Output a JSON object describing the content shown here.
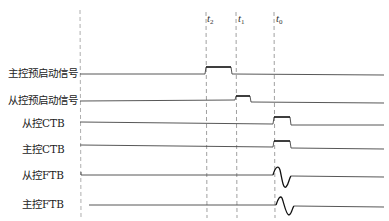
{
  "diagram": {
    "type": "timing-diagram",
    "colors": {
      "signal": "#444444",
      "pulse": "#222222",
      "dashed": "#888888",
      "background": "#ffffff"
    },
    "time_markers": [
      {
        "id": "t2",
        "base": "t",
        "sub": "2",
        "x": 206
      },
      {
        "id": "t1",
        "base": "t",
        "sub": "1",
        "x": 236
      },
      {
        "id": "t0",
        "base": "t",
        "sub": "0",
        "x": 274
      }
    ],
    "signals": [
      {
        "name": "master-pre-start",
        "label": "主控预启动信号",
        "y": 74,
        "event": "pulse",
        "start": "t2",
        "end_x": 231
      },
      {
        "name": "slave-pre-start",
        "label": "从控预启动信号",
        "y": 101,
        "event": "pulse",
        "start": "t1",
        "end_x": 250
      },
      {
        "name": "slave-ctb",
        "label": "从控CTB",
        "y": 123,
        "event": "pulse",
        "start": "t0",
        "end_x": 290
      },
      {
        "name": "master-ctb",
        "label": "主控CTB",
        "y": 148,
        "event": "pulse",
        "start": "t0",
        "end_x": 290
      },
      {
        "name": "slave-ftb",
        "label": "从控FTB",
        "y": 175,
        "event": "oscillation",
        "start": "t0"
      },
      {
        "name": "master-ftb",
        "label": "主控FTB",
        "y": 205,
        "event": "oscillation",
        "start": "t0"
      }
    ]
  }
}
